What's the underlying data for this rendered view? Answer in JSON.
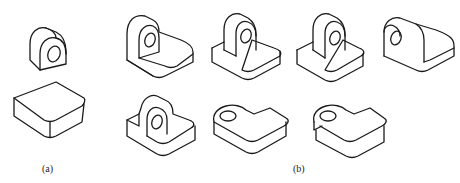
{
  "figure": {
    "background": "#ffffff",
    "line_color": "#1a1a1a",
    "groups": [
      {
        "id": "a",
        "caption": "(a)",
        "parts": [
          {
            "name": "rounded-lug-with-hole",
            "description": "Half-round upright lug with through hole"
          },
          {
            "name": "rounded-base-plate",
            "description": "Rectangular base plate with one rounded corner"
          }
        ]
      },
      {
        "id": "b",
        "caption": "(b)",
        "parts": [
          {
            "name": "combination-1",
            "description": "Lug placed at back-left edge of base plate"
          },
          {
            "name": "combination-2",
            "description": "Lug centered on back portion of base plate"
          },
          {
            "name": "combination-3",
            "description": "Lug centered on base plate"
          },
          {
            "name": "combination-4",
            "description": "Lug at left edge, hole facing left"
          },
          {
            "name": "combination-5",
            "description": "Lug partially embedded in base plate"
          },
          {
            "name": "combination-6",
            "description": "Lug lying flat, merged into plate top"
          },
          {
            "name": "combination-7",
            "description": "Flat lug with notch at plate edge"
          }
        ]
      }
    ]
  }
}
